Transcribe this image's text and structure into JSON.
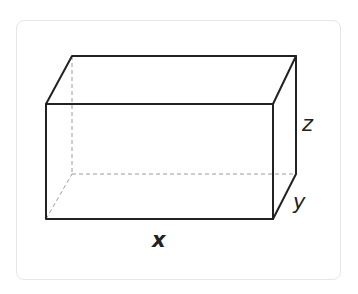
{
  "diagram": {
    "labels": {
      "x": "x",
      "y": "y",
      "z": "z"
    },
    "colors": {
      "edge": "#222222",
      "hidden_edge": "#9a9a9a",
      "card_border": "#e6e6e6"
    },
    "vertices": {
      "front_top_left": [
        46,
        104
      ],
      "front_top_right": [
        273,
        104
      ],
      "front_bottom_left": [
        46,
        219
      ],
      "front_bottom_right": [
        273,
        219
      ],
      "back_top_left": [
        72,
        56
      ],
      "back_top_right": [
        296,
        56
      ],
      "back_bottom_left": [
        72,
        174
      ],
      "back_bottom_right": [
        296,
        174
      ]
    }
  }
}
